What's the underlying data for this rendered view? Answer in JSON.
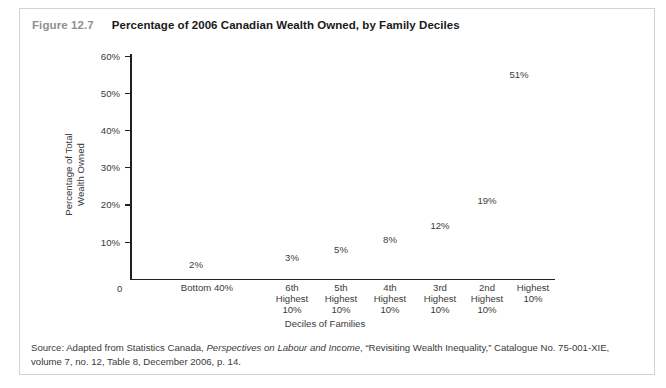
{
  "figure": {
    "number": "Figure 12.7",
    "title": "Percentage of 2006 Canadian Wealth Owned, by Family Deciles",
    "source_prefix": "Source: Adapted from Statistics Canada, ",
    "source_italic": "Perspectives on Labour and Income",
    "source_suffix": ", “Revisiting Wealth Inequality,” Catalogue No. 75-001-XIE, volume 7, no. 12, Table 8, December 2006, p. 14."
  },
  "colors": {
    "frame_border": "#d2d2d2",
    "axis": "#231f20",
    "text": "#3a3a3a",
    "figure_number": "#8f8f8f",
    "title": "#1a1a1a",
    "background": "#ffffff"
  },
  "axes": {
    "y_origin_label": "0",
    "y_ticks": [
      "10%",
      "20%",
      "30%",
      "40%",
      "50%",
      "60%"
    ],
    "x_title": "Deciles of Families",
    "y_title_line1": "Percentage of Total",
    "y_title_line2": "Wealth Owned"
  },
  "chart_data": {
    "type": "scatter",
    "title": "Percentage of 2006 Canadian Wealth Owned, by Family Deciles",
    "xlabel": "Deciles of Families",
    "ylabel": "Percentage of Total Wealth Owned",
    "categories": [
      "Bottom 40%",
      "6th Highest 10%",
      "5th Highest 10%",
      "4th Highest 10%",
      "3rd Highest 10%",
      "2nd Highest 10%",
      "Highest 10%"
    ],
    "category_lines": [
      [
        "Bottom 40%"
      ],
      [
        "6th",
        "Highest",
        "10%"
      ],
      [
        "5th",
        "Highest",
        "10%"
      ],
      [
        "4th",
        "Highest",
        "10%"
      ],
      [
        "3rd",
        "Highest",
        "10%"
      ],
      [
        "2nd",
        "Highest",
        "10%"
      ],
      [
        "Highest",
        "10%"
      ]
    ],
    "values": [
      2,
      3,
      5,
      8,
      12,
      19,
      51
    ],
    "data_labels": [
      "2%",
      "3%",
      "5%",
      "8%",
      "12%",
      "19%",
      "51%"
    ],
    "ylim": [
      0,
      60
    ],
    "ytick_values": [
      10,
      20,
      30,
      40,
      50,
      60
    ],
    "ytick_labels": [
      "10%",
      "20%",
      "30%",
      "40%",
      "50%",
      "60%"
    ],
    "grid": false,
    "legend": "none"
  },
  "layout": {
    "label_positions": [
      {
        "x": 196,
        "y": 264
      },
      {
        "x": 292,
        "y": 257
      },
      {
        "x": 341,
        "y": 249
      },
      {
        "x": 390,
        "y": 239
      },
      {
        "x": 440,
        "y": 225
      },
      {
        "x": 487,
        "y": 200
      },
      {
        "x": 519,
        "y": 74
      }
    ],
    "category_positions": [
      207,
      292,
      341,
      390,
      440,
      487,
      533
    ],
    "ytick_positions": [
      241.5,
      204.4,
      167.2,
      130.1,
      93,
      55.8
    ]
  }
}
